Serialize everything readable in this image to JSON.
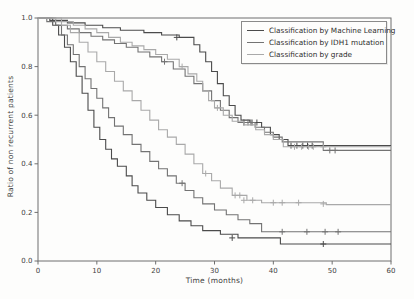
{
  "chart_data": {
    "type": "line",
    "subtype": "kaplan_meier_step",
    "title": "",
    "xlabel": "Time (months)",
    "ylabel": "Ratio of non recurrent patients",
    "xlim": [
      0,
      60
    ],
    "ylim": [
      0.0,
      1.0
    ],
    "xticks": [
      "0",
      "10",
      "20",
      "30",
      "40",
      "50",
      "60"
    ],
    "yticks": [
      "0.0",
      "0.2",
      "0.4",
      "0.6",
      "0.8",
      "1.0"
    ],
    "grid": "off",
    "legend_position": "upper right",
    "frame_color": "#6f6f6f",
    "text_color": "#3f3f3f",
    "legend": [
      {
        "label": "Classification by Machine Learning",
        "color": "#4b4b4b"
      },
      {
        "label": "Classification by IDH1 mutation",
        "color": "#737373"
      },
      {
        "label": "Classification by grade",
        "color": "#a9a9a9"
      }
    ],
    "series": [
      {
        "name": "machine-learning-upper",
        "group": "Classification by Machine Learning",
        "color": "#4b4b4b",
        "points": [
          [
            0,
            1.0
          ],
          [
            2,
            0.99
          ],
          [
            5,
            0.98
          ],
          [
            8,
            0.97
          ],
          [
            11,
            0.96
          ],
          [
            14,
            0.95
          ],
          [
            18,
            0.94
          ],
          [
            21,
            0.93
          ],
          [
            24,
            0.92
          ],
          [
            26.5,
            0.89
          ],
          [
            27.5,
            0.86
          ],
          [
            28.5,
            0.82
          ],
          [
            29.5,
            0.78
          ],
          [
            30.5,
            0.73
          ],
          [
            31.5,
            0.68
          ],
          [
            32.5,
            0.64
          ],
          [
            33.5,
            0.6
          ],
          [
            34.5,
            0.58
          ],
          [
            36,
            0.57
          ],
          [
            38,
            0.55
          ],
          [
            39.5,
            0.52
          ],
          [
            41,
            0.5
          ],
          [
            42.5,
            0.475
          ]
        ],
        "censors": [
          [
            23.6,
            0.92
          ],
          [
            35,
            0.57
          ],
          [
            36.2,
            0.57
          ],
          [
            37.2,
            0.57
          ],
          [
            43,
            0.475
          ],
          [
            44,
            0.475
          ],
          [
            45,
            0.475
          ],
          [
            45.8,
            0.475
          ],
          [
            46.6,
            0.475
          ]
        ]
      },
      {
        "name": "machine-learning-lower",
        "group": "Classification by Machine Learning",
        "color": "#4b4b4b",
        "points": [
          [
            0,
            1.0
          ],
          [
            2.5,
            0.97
          ],
          [
            3.5,
            0.93
          ],
          [
            4.5,
            0.88
          ],
          [
            5.5,
            0.82
          ],
          [
            6.5,
            0.76
          ],
          [
            7.5,
            0.69
          ],
          [
            8.5,
            0.62
          ],
          [
            9.5,
            0.55
          ],
          [
            10.5,
            0.5
          ],
          [
            11.5,
            0.46
          ],
          [
            12.5,
            0.42
          ],
          [
            13.5,
            0.39
          ],
          [
            15,
            0.35
          ],
          [
            16,
            0.31
          ],
          [
            17,
            0.28
          ],
          [
            18.5,
            0.25
          ],
          [
            20,
            0.22
          ],
          [
            22,
            0.19
          ],
          [
            24,
            0.165
          ],
          [
            26,
            0.145
          ],
          [
            28,
            0.125
          ],
          [
            31,
            0.11
          ],
          [
            34,
            0.095
          ],
          [
            41.2,
            0.07
          ]
        ],
        "censors": [
          [
            33,
            0.095
          ],
          [
            48.5,
            0.07
          ]
        ]
      },
      {
        "name": "idh1-upper",
        "group": "Classification by IDH1 mutation",
        "color": "#737373",
        "points": [
          [
            0,
            1.0
          ],
          [
            1.5,
            0.985
          ],
          [
            3,
            0.97
          ],
          [
            5,
            0.955
          ],
          [
            7,
            0.94
          ],
          [
            9,
            0.925
          ],
          [
            11,
            0.91
          ],
          [
            13,
            0.895
          ],
          [
            15,
            0.88
          ],
          [
            17,
            0.86
          ],
          [
            19,
            0.84
          ],
          [
            21,
            0.82
          ],
          [
            23,
            0.79
          ],
          [
            25,
            0.76
          ],
          [
            26.5,
            0.73
          ],
          [
            28,
            0.7
          ],
          [
            29.5,
            0.66
          ],
          [
            31,
            0.62
          ],
          [
            32.5,
            0.59
          ],
          [
            34,
            0.57
          ],
          [
            36.9,
            0.55
          ],
          [
            38.5,
            0.53
          ],
          [
            40,
            0.51
          ],
          [
            41.5,
            0.49
          ],
          [
            48.5,
            0.455
          ]
        ],
        "censors": [
          [
            21.5,
            0.82
          ],
          [
            35.7,
            0.57
          ],
          [
            36.4,
            0.57
          ],
          [
            49.6,
            0.455
          ],
          [
            50.5,
            0.455
          ]
        ]
      },
      {
        "name": "idh1-lower",
        "group": "Classification by IDH1 mutation",
        "color": "#737373",
        "points": [
          [
            0,
            1.0
          ],
          [
            3,
            0.97
          ],
          [
            4,
            0.93
          ],
          [
            5,
            0.89
          ],
          [
            6,
            0.85
          ],
          [
            7,
            0.8
          ],
          [
            8,
            0.75
          ],
          [
            9,
            0.71
          ],
          [
            10,
            0.67
          ],
          [
            11,
            0.63
          ],
          [
            12,
            0.59
          ],
          [
            13,
            0.555
          ],
          [
            14.5,
            0.52
          ],
          [
            16,
            0.48
          ],
          [
            17.5,
            0.45
          ],
          [
            19,
            0.41
          ],
          [
            20.5,
            0.38
          ],
          [
            22,
            0.35
          ],
          [
            23.5,
            0.32
          ],
          [
            25,
            0.29
          ],
          [
            26.5,
            0.26
          ],
          [
            28,
            0.235
          ],
          [
            30,
            0.21
          ],
          [
            32,
            0.19
          ],
          [
            34,
            0.17
          ],
          [
            36,
            0.154
          ],
          [
            38,
            0.12
          ]
        ],
        "censors": [
          [
            24.5,
            0.32
          ],
          [
            41.5,
            0.12
          ],
          [
            45.7,
            0.12
          ],
          [
            48.8,
            0.12
          ],
          [
            51,
            0.12
          ]
        ]
      },
      {
        "name": "grade-upper",
        "group": "Classification by grade",
        "color": "#a9a9a9",
        "points": [
          [
            0,
            1.0
          ],
          [
            3,
            0.985
          ],
          [
            6,
            0.97
          ],
          [
            8,
            0.955
          ],
          [
            10,
            0.94
          ],
          [
            12,
            0.92
          ],
          [
            14,
            0.9
          ],
          [
            16,
            0.885
          ],
          [
            18,
            0.87
          ],
          [
            20,
            0.85
          ],
          [
            22,
            0.83
          ],
          [
            24,
            0.8
          ],
          [
            25.5,
            0.77
          ],
          [
            27,
            0.74
          ],
          [
            28,
            0.7
          ],
          [
            29,
            0.66
          ],
          [
            30,
            0.63
          ],
          [
            31.5,
            0.6
          ],
          [
            33,
            0.575
          ],
          [
            35,
            0.56
          ],
          [
            37,
            0.54
          ],
          [
            38.5,
            0.52
          ],
          [
            40,
            0.5
          ],
          [
            41.7,
            0.47
          ]
        ],
        "censors": [
          [
            24.5,
            0.8
          ],
          [
            30.5,
            0.63
          ],
          [
            43.6,
            0.47
          ],
          [
            44.8,
            0.47
          ],
          [
            46,
            0.47
          ],
          [
            46.8,
            0.47
          ],
          [
            48.5,
            0.47
          ]
        ]
      },
      {
        "name": "grade-lower",
        "group": "Classification by grade",
        "color": "#a9a9a9",
        "points": [
          [
            0,
            1.0
          ],
          [
            4,
            0.97
          ],
          [
            5.5,
            0.94
          ],
          [
            7,
            0.9
          ],
          [
            8.5,
            0.86
          ],
          [
            10,
            0.82
          ],
          [
            11.5,
            0.78
          ],
          [
            13,
            0.74
          ],
          [
            14.5,
            0.7
          ],
          [
            16,
            0.66
          ],
          [
            17.5,
            0.62
          ],
          [
            19,
            0.58
          ],
          [
            20.5,
            0.54
          ],
          [
            22,
            0.51
          ],
          [
            23.5,
            0.48
          ],
          [
            25,
            0.44
          ],
          [
            26.5,
            0.4
          ],
          [
            28,
            0.36
          ],
          [
            29.5,
            0.33
          ],
          [
            31,
            0.3
          ],
          [
            33,
            0.27
          ],
          [
            35.5,
            0.25
          ],
          [
            38,
            0.24
          ],
          [
            49,
            0.232
          ]
        ],
        "censors": [
          [
            28.5,
            0.36
          ],
          [
            33.5,
            0.27
          ],
          [
            34.3,
            0.27
          ],
          [
            35,
            0.25
          ],
          [
            36.5,
            0.25
          ],
          [
            40,
            0.24
          ],
          [
            41.5,
            0.24
          ],
          [
            44.3,
            0.24
          ],
          [
            48.5,
            0.235
          ]
        ]
      }
    ]
  }
}
